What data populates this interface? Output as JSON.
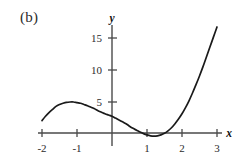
{
  "figure": {
    "panel_label": "(b)",
    "background_color": "#ffffff",
    "curve_color": "#1a1a1a",
    "axis_color": "#4a4a4a",
    "text_color": "#2b2b2b"
  },
  "chart_data": {
    "type": "line",
    "title": "",
    "subtitle": "",
    "xlabel": "x",
    "ylabel": "y",
    "xlim": [
      -2.2,
      3.3
    ],
    "ylim": [
      -2.5,
      18.5
    ],
    "grid": false,
    "legend": null,
    "x_ticks": [
      -2,
      -1,
      1,
      2,
      3
    ],
    "x_tick_labels": [
      "-2",
      "-1",
      "1",
      "2",
      "3"
    ],
    "y_ticks": [
      5,
      10,
      15
    ],
    "y_tick_labels": [
      "5",
      "10",
      "15"
    ],
    "annotations": [],
    "series": [
      {
        "name": "curve",
        "x": [
          -2.0,
          -1.9,
          -1.8,
          -1.7,
          -1.6,
          -1.5,
          -1.4,
          -1.3,
          -1.2,
          -1.1,
          -1.0,
          -0.9,
          -0.8,
          -0.7,
          -0.6,
          -0.5,
          -0.4,
          -0.3,
          -0.2,
          -0.1,
          0.0,
          0.1,
          0.2,
          0.3,
          0.4,
          0.5,
          0.6,
          0.7,
          0.8,
          0.9,
          1.0,
          1.1,
          1.2,
          1.3,
          1.4,
          1.5,
          1.6,
          1.7,
          1.8,
          1.9,
          2.0,
          2.1,
          2.2,
          2.3,
          2.4,
          2.5,
          2.6,
          2.7,
          2.8,
          2.9,
          3.0
        ],
        "y": [
          2.0,
          2.7,
          3.3,
          3.8,
          4.3,
          4.6,
          4.8,
          4.95,
          5.0,
          5.0,
          4.9,
          4.8,
          4.6,
          4.4,
          4.15,
          3.9,
          3.6,
          3.35,
          3.1,
          2.9,
          2.7,
          2.4,
          2.1,
          1.8,
          1.5,
          1.1,
          0.75,
          0.45,
          0.15,
          -0.1,
          -0.3,
          -0.45,
          -0.5,
          -0.45,
          -0.3,
          -0.05,
          0.35,
          0.85,
          1.5,
          2.25,
          3.1,
          4.1,
          5.2,
          6.45,
          7.8,
          9.2,
          10.7,
          12.3,
          13.9,
          15.5,
          17.1
        ]
      }
    ]
  }
}
